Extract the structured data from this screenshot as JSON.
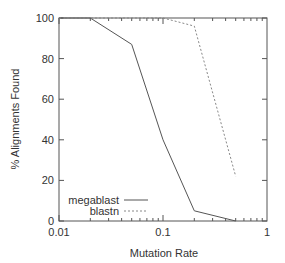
{
  "chart_data": {
    "type": "line",
    "title": "",
    "xlabel": "Mutation Rate",
    "ylabel": "% Alignments Found",
    "xscale": "log",
    "xlim": [
      0.01,
      1
    ],
    "ylim": [
      0,
      100
    ],
    "x_ticks": [
      "0.01",
      "0.1",
      "1"
    ],
    "y_ticks": [
      "0",
      "20",
      "40",
      "60",
      "80",
      "100"
    ],
    "grid": false,
    "legend_position": "lower left",
    "x": [
      0.01,
      0.02,
      0.05,
      0.1,
      0.2,
      0.5
    ],
    "series": [
      {
        "name": "megablast",
        "style": "solid",
        "values": [
          100,
          100,
          87,
          40,
          5,
          0
        ]
      },
      {
        "name": "blastn",
        "style": "dotted",
        "values": [
          100,
          100,
          100,
          100,
          96,
          22
        ]
      }
    ]
  },
  "colors": {
    "axis": "#555555",
    "megablast": "#555555",
    "blastn": "#888888"
  }
}
